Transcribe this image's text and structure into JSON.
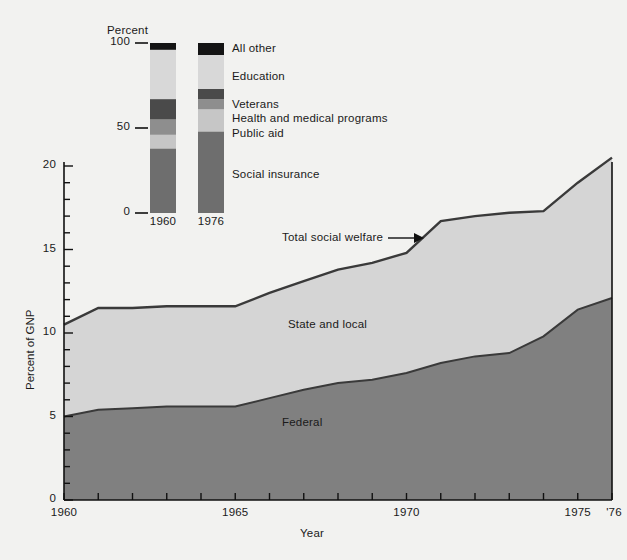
{
  "chart_data": {
    "type": "area",
    "title": "",
    "xlabel": "Year",
    "ylabel": "Percent of GNP",
    "xlim": [
      1960,
      1976
    ],
    "ylim": [
      0,
      20
    ],
    "xticks": [
      1960,
      1965,
      1970,
      1975,
      1976
    ],
    "xtick_labels": [
      "1960",
      "1965",
      "1970",
      "1975",
      "'76"
    ],
    "yticks": [
      0,
      5,
      10,
      15,
      20
    ],
    "ytick_labels": [
      "0",
      "5",
      "10",
      "15",
      "20"
    ],
    "grid": false,
    "legend_position": "in-plot-labels",
    "x": [
      1960,
      1961,
      1962,
      1963,
      1964,
      1965,
      1966,
      1967,
      1968,
      1969,
      1970,
      1971,
      1972,
      1973,
      1974,
      1975,
      1976
    ],
    "series": [
      {
        "name": "Federal",
        "values": [
          5.0,
          5.4,
          5.5,
          5.6,
          5.6,
          5.6,
          6.1,
          6.6,
          7.0,
          7.2,
          7.6,
          8.2,
          8.6,
          8.8,
          9.8,
          11.4,
          12.1
        ],
        "color": "#808080",
        "label_text": "Federal"
      },
      {
        "name": "State and local",
        "values": [
          5.5,
          6.1,
          6.0,
          6.0,
          6.0,
          6.0,
          6.3,
          6.5,
          6.8,
          7.0,
          7.2,
          8.5,
          8.4,
          8.4,
          7.5,
          7.6,
          8.4
        ],
        "color": "#d5d5d5",
        "label_text": "State and local"
      }
    ],
    "total_series": {
      "name": "Total social welfare",
      "values": [
        10.5,
        11.5,
        11.5,
        11.6,
        11.6,
        11.6,
        12.4,
        13.1,
        13.8,
        14.2,
        14.8,
        16.7,
        17.0,
        17.2,
        17.3,
        19.0,
        20.5
      ],
      "annotation": "Total social welfare"
    },
    "inset": {
      "axis_title": "Percent",
      "yticks": [
        0,
        50,
        100
      ],
      "ytick_labels": [
        "0",
        "50",
        "100"
      ],
      "bars": [
        {
          "label": "1960",
          "segments": [
            {
              "name": "Social insurance",
              "value": 38.0,
              "color": "#6e6e6e"
            },
            {
              "name": "Public aid",
              "value": 8.0,
              "color": "#c6c6c6"
            },
            {
              "name": "Health and medical programs",
              "value": 9.0,
              "color": "#8e8e8e"
            },
            {
              "name": "Veterans",
              "value": 12.0,
              "color": "#4a4a4a"
            },
            {
              "name": "Education",
              "value": 29.0,
              "color": "#d8d8d8"
            },
            {
              "name": "All other",
              "value": 4.0,
              "color": "#141414"
            }
          ]
        },
        {
          "label": "1976",
          "segments": [
            {
              "name": "Social insurance",
              "value": 48.0,
              "color": "#6e6e6e"
            },
            {
              "name": "Public aid",
              "value": 13.0,
              "color": "#c6c6c6"
            },
            {
              "name": "Health and medical programs",
              "value": 6.0,
              "color": "#8e8e8e"
            },
            {
              "name": "Veterans",
              "value": 6.0,
              "color": "#4a4a4a"
            },
            {
              "name": "Education",
              "value": 23.0,
              "color": "#d8d8d8"
            },
            {
              "name": "All other",
              "value": 4.0,
              "color": "#141414"
            }
          ]
        }
      ],
      "legend": [
        {
          "name": "All other",
          "label": "All other"
        },
        {
          "name": "Education",
          "label": "Education"
        },
        {
          "name": "Veterans",
          "label": "Veterans"
        },
        {
          "name": "Health and medical programs",
          "label": "Health and medical programs"
        },
        {
          "name": "Public aid",
          "label": "Public aid"
        },
        {
          "name": "Social insurance",
          "label": "Social insurance"
        }
      ]
    },
    "colors": {
      "federal": "#808080",
      "state_local": "#d5d5d5",
      "outline": "#3a3a3a",
      "background": "#f2f2f0",
      "axis": "#111111"
    }
  },
  "labels": {
    "percent": "Percent",
    "percent_of_gnp": "Percent of GNP",
    "year": "Year",
    "total_social_welfare": "Total social welfare",
    "state_and_local": "State and local",
    "federal": "Federal",
    "inset_100": "100",
    "inset_50": "50",
    "inset_0": "0",
    "inset_year_1960": "1960",
    "inset_year_1976": "1976",
    "legend_all_other": "All other",
    "legend_education": "Education",
    "legend_veterans": "Veterans",
    "legend_health": "Health and medical programs",
    "legend_public_aid": "Public aid",
    "legend_social_insurance": "Social insurance",
    "y_20": "20",
    "y_15": "15",
    "y_10": "10",
    "y_5": "5",
    "y_0": "0",
    "x_1960": "1960",
    "x_1965": "1965",
    "x_1970": "1970",
    "x_1975": "1975",
    "x_1976": "'76"
  }
}
